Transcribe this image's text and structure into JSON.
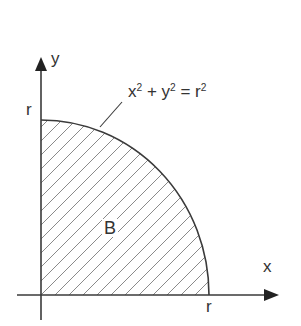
{
  "figure": {
    "type": "quarter-disk region diagram",
    "colors": {
      "line": "#3a3a3a",
      "hatch": "#8a8a8a",
      "text": "#333333",
      "background": "#ffffff"
    }
  },
  "axes": {
    "x_label": "x",
    "y_label": "y",
    "x_intercept_label": "r",
    "y_intercept_label": "r"
  },
  "region": {
    "label": "B",
    "fill": "diagonal hatching"
  },
  "curve": {
    "equation_parts": {
      "x": "x",
      "x_exp": "2",
      "plus": " + ",
      "y": "y",
      "y_exp": "2",
      "equals": " = ",
      "r": "r",
      "r_exp": "2"
    }
  }
}
